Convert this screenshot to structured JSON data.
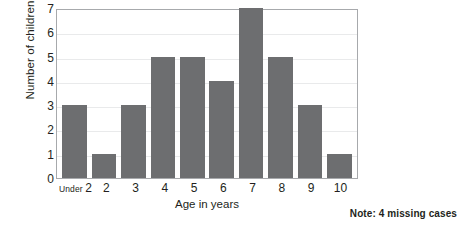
{
  "chart_data": {
    "type": "bar",
    "title": "",
    "xlabel": "Age in years",
    "ylabel": "Number of children",
    "categories": [
      "Under 2",
      "2",
      "3",
      "4",
      "5",
      "6",
      "7",
      "8",
      "9",
      "10"
    ],
    "values": [
      3,
      1,
      3,
      5,
      5,
      4,
      7,
      5,
      3,
      1
    ],
    "ylim": [
      0,
      7
    ],
    "yticks": [
      0,
      1,
      2,
      3,
      4,
      5,
      6,
      7
    ],
    "ytick_labels": [
      "0",
      "1",
      "2",
      "3",
      "4",
      "5",
      "6",
      "7"
    ],
    "grid": true,
    "legend": null,
    "annotations": [
      "Note: 4 missing cases"
    ],
    "series": [
      {
        "name": "Number of children",
        "values": [
          3,
          1,
          3,
          5,
          5,
          4,
          7,
          5,
          3,
          1
        ]
      }
    ],
    "colors": {
      "bar": "#6d6e70",
      "gridline": "#e9eaeb",
      "axis": "#a7a9ac",
      "text": "#231f20",
      "background": "#ffffff"
    }
  },
  "footnote": {
    "text": "Note: 4 missing cases"
  },
  "first_category": {
    "prefix": "Under",
    "value": "2"
  }
}
